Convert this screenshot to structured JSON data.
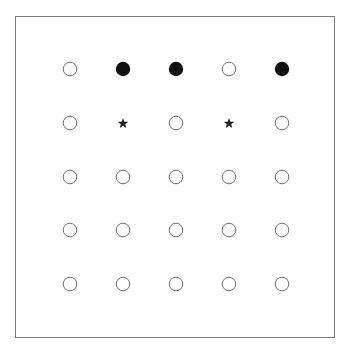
{
  "board": {
    "rows": 5,
    "cols": 5,
    "col_x": [
      70,
      123,
      176,
      229,
      282
    ],
    "row_y": [
      69,
      123,
      177,
      230,
      284
    ],
    "colors": {
      "stroke": "#6e6e6e",
      "fill": "#111111",
      "star": "#222222"
    },
    "grid": [
      [
        "empty-circle",
        "filled-circle",
        "filled-circle",
        "empty-circle",
        "filled-circle"
      ],
      [
        "empty-circle",
        "star",
        "empty-circle",
        "star",
        "empty-circle"
      ],
      [
        "empty-circle",
        "empty-circle",
        "empty-circle",
        "empty-circle",
        "empty-circle"
      ],
      [
        "empty-circle",
        "empty-circle",
        "empty-circle",
        "empty-circle",
        "empty-circle"
      ],
      [
        "empty-circle",
        "empty-circle",
        "empty-circle",
        "empty-circle",
        "empty-circle"
      ]
    ]
  }
}
